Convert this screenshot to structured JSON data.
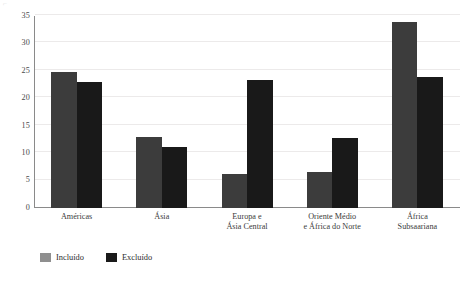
{
  "chart_data": {
    "type": "bar",
    "title": "",
    "subtitle": "",
    "xlabel": "",
    "ylabel": "",
    "categories": [
      "Américas",
      "Ásia",
      "Europa e\nÁsia Central",
      "Oriente Médio\ne África do Norte",
      "África\nSubsaariana"
    ],
    "category_lines": [
      [
        "Américas"
      ],
      [
        "Ásia"
      ],
      [
        "Europa e",
        "Ásia Central"
      ],
      [
        "Oriente Médio",
        "e África do Norte"
      ],
      [
        "África",
        "Subsaariana"
      ]
    ],
    "series": [
      {
        "name": "Incluído",
        "color": "#3c3c3c",
        "values": [
          24.8,
          13.0,
          6.2,
          6.6,
          33.9
        ]
      },
      {
        "name": "Excluído",
        "color": "#191919",
        "values": [
          23.0,
          11.1,
          23.4,
          12.7,
          23.8
        ]
      }
    ],
    "ylim": [
      0,
      35
    ],
    "yticks": [
      0,
      5,
      10,
      15,
      20,
      25,
      30,
      35
    ],
    "ytick_labels": [
      "0",
      "5",
      "10",
      "15",
      "20",
      "25",
      "30",
      "35"
    ],
    "grid": true,
    "grid_axis": "y",
    "grid_color": "#eceaea",
    "legend": {
      "position": "bottom-left",
      "entries": [
        {
          "label": "Incluído",
          "color": "#8f8f8f"
        },
        {
          "label": "Excluído",
          "color": "#1a1a1a"
        }
      ]
    },
    "axis_color": "#8a8a8a",
    "background": "#ffffff"
  },
  "marks": {
    "top_left_artifact": "⌐"
  }
}
